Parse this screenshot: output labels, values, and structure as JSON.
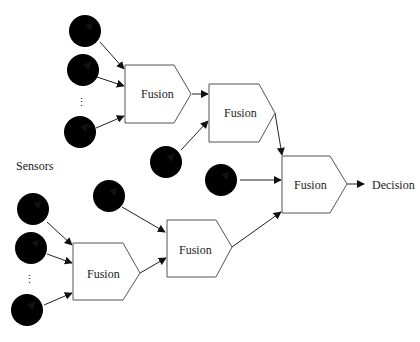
{
  "diagram": {
    "sensors_label": "Sensors",
    "ellipsis": "⋮",
    "decision_label": "Decision",
    "nodes": [
      {
        "id": "fusion-a",
        "label": "Fusion"
      },
      {
        "id": "fusion-b",
        "label": "Fusion"
      },
      {
        "id": "fusion-c",
        "label": "Fusion"
      },
      {
        "id": "fusion-d",
        "label": "Fusion"
      },
      {
        "id": "fusion-e",
        "label": "Fusion"
      }
    ],
    "sensor_icon": "gauge-dial-icon",
    "edges": [
      {
        "from": "sensor-1",
        "to": "fusion-a"
      },
      {
        "from": "sensor-2",
        "to": "fusion-a"
      },
      {
        "from": "sensor-3",
        "to": "fusion-a"
      },
      {
        "from": "fusion-a",
        "to": "fusion-b"
      },
      {
        "from": "sensor-4",
        "to": "fusion-b"
      },
      {
        "from": "fusion-b",
        "to": "fusion-c"
      },
      {
        "from": "sensor-5",
        "to": "fusion-c"
      },
      {
        "from": "sensor-6",
        "to": "fusion-d"
      },
      {
        "from": "sensor-7",
        "to": "fusion-d"
      },
      {
        "from": "sensor-8",
        "to": "fusion-d"
      },
      {
        "from": "sensor-9",
        "to": "fusion-e"
      },
      {
        "from": "fusion-d",
        "to": "fusion-e"
      },
      {
        "from": "fusion-e",
        "to": "fusion-c"
      },
      {
        "from": "fusion-c",
        "to": "decision"
      }
    ]
  }
}
